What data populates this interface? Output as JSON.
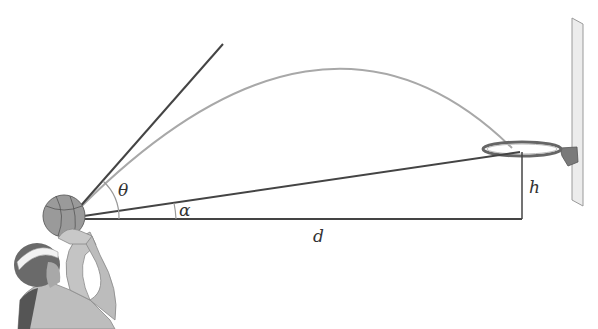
{
  "diagram": {
    "labels": {
      "theta": "θ",
      "alpha": "α",
      "d": "d",
      "h": "h"
    },
    "elements": [
      "player",
      "basketball",
      "launch-ray",
      "trajectory",
      "line-of-sight",
      "horizontal-distance",
      "vertical-height",
      "hoop-rim",
      "backboard"
    ],
    "colors": {
      "line": "#444444",
      "trajectory": "#a0a0a0",
      "angle_arc": "#9a9a9a",
      "ball": "#8a8a8a",
      "backboard": "#e4e4e4"
    }
  }
}
